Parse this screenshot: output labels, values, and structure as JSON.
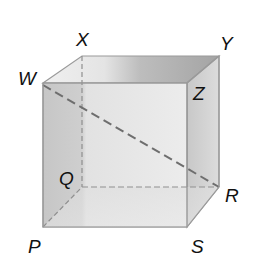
{
  "diagram": {
    "type": "cube",
    "vertices": {
      "W": {
        "label": "W",
        "x": 43,
        "y": 83,
        "position": "front-top-left"
      },
      "Z": {
        "label": "Z",
        "x": 187,
        "y": 83,
        "position": "front-top-right"
      },
      "P": {
        "label": "P",
        "x": 43,
        "y": 227,
        "position": "front-bottom-left"
      },
      "S": {
        "label": "S",
        "x": 187,
        "y": 227,
        "position": "front-bottom-right"
      },
      "X": {
        "label": "X",
        "x": 82,
        "y": 56,
        "position": "back-top-left"
      },
      "Y": {
        "label": "Y",
        "x": 219,
        "y": 56,
        "position": "back-top-right"
      },
      "Q": {
        "label": "Q",
        "x": 82,
        "y": 187,
        "position": "back-bottom-left"
      },
      "R": {
        "label": "R",
        "x": 219,
        "y": 187,
        "position": "back-bottom-right"
      }
    },
    "hidden_edges": [
      "XQ",
      "QR",
      "PQ"
    ],
    "diagonal": {
      "from": "W",
      "to": "R",
      "style": "dashed"
    },
    "colors": {
      "edge": "#9a9a9a",
      "hidden_edge": "#8f8f8f",
      "diagonal": "#6e6e6e",
      "front_face": "#e6e6e6",
      "top_face_light": "#e9e9e9",
      "top_face_dark": "#a9a9a9",
      "right_face": "#d2d2d2",
      "left_shade": "#c4c4c4",
      "label": "#111111"
    }
  }
}
